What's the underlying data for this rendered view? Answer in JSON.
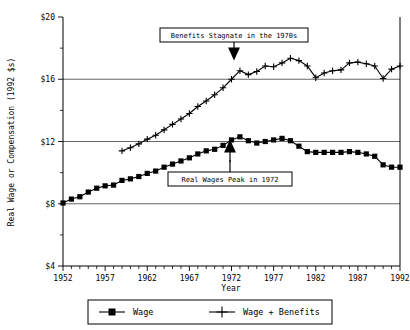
{
  "chart_data": {
    "type": "line",
    "title": "",
    "xlabel": "Year",
    "ylabel": "Real Wage or Compensation (1992 $s)",
    "xlim": [
      1952,
      1992
    ],
    "ylim": [
      4,
      20
    ],
    "yticks": [
      "$4",
      "$8",
      "$12",
      "$16",
      "$20"
    ],
    "ytick_values": [
      4,
      8,
      12,
      16,
      20
    ],
    "xticks": [
      "1952",
      "1957",
      "1962",
      "1967",
      "1972",
      "1977",
      "1982",
      "1987",
      "1992"
    ],
    "xtick_values": [
      1952,
      1957,
      1962,
      1967,
      1972,
      1977,
      1982,
      1987,
      1992
    ],
    "grid": "horizontal",
    "legend_position": "bottom",
    "series": [
      {
        "name": "Wage",
        "marker": "filled-square",
        "x": [
          1952,
          1953,
          1954,
          1955,
          1956,
          1957,
          1958,
          1959,
          1960,
          1961,
          1962,
          1963,
          1964,
          1965,
          1966,
          1967,
          1968,
          1969,
          1970,
          1971,
          1972,
          1973,
          1974,
          1975,
          1976,
          1977,
          1978,
          1979,
          1980,
          1981,
          1982,
          1983,
          1984,
          1985,
          1986,
          1987,
          1988,
          1989,
          1990,
          1991,
          1992
        ],
        "values": [
          8.05,
          8.3,
          8.45,
          8.75,
          9.0,
          9.15,
          9.2,
          9.5,
          9.6,
          9.75,
          9.95,
          10.1,
          10.35,
          10.55,
          10.75,
          10.95,
          11.2,
          11.4,
          11.5,
          11.75,
          12.1,
          12.3,
          12.05,
          11.9,
          12.0,
          12.1,
          12.2,
          12.05,
          11.7,
          11.35,
          11.3,
          11.3,
          11.3,
          11.3,
          11.35,
          11.3,
          11.2,
          11.05,
          10.5,
          10.35,
          10.35
        ]
      },
      {
        "name": "Wage + Benefits",
        "marker": "plus",
        "x": [
          1959,
          1960,
          1961,
          1962,
          1963,
          1964,
          1965,
          1966,
          1967,
          1968,
          1969,
          1970,
          1971,
          1972,
          1973,
          1974,
          1975,
          1976,
          1977,
          1978,
          1979,
          1980,
          1981,
          1982,
          1983,
          1984,
          1985,
          1986,
          1987,
          1988,
          1989,
          1990,
          1991,
          1992
        ],
        "values": [
          11.4,
          11.6,
          11.85,
          12.15,
          12.4,
          12.75,
          13.1,
          13.45,
          13.8,
          14.25,
          14.6,
          15.0,
          15.45,
          16.0,
          16.55,
          16.3,
          16.5,
          16.85,
          16.8,
          17.05,
          17.35,
          17.2,
          16.85,
          16.1,
          16.4,
          16.55,
          16.6,
          17.05,
          17.1,
          17.0,
          16.85,
          16.05,
          16.65,
          16.85
        ]
      }
    ],
    "annotations": [
      {
        "text": "Benefits Stagnate in the 1970s",
        "pointer": "down-arrow",
        "target_x": 1972,
        "target_y": 16.0
      },
      {
        "text": "Real Wages Peak in 1972",
        "pointer": "up-arrow",
        "target_x": 1972,
        "target_y": 12.1
      }
    ],
    "legend": [
      {
        "label": "Wage",
        "marker": "filled-square"
      },
      {
        "label": "Wage + Benefits",
        "marker": "plus"
      }
    ]
  },
  "colors": {
    "ink": "#000000",
    "background": "#ffffff",
    "gridline": "#555555"
  }
}
